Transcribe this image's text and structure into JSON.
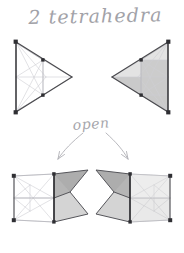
{
  "page": {
    "width": 184,
    "height": 253,
    "background_color": "#ffffff",
    "medium": "pencil-sketch",
    "title": "2 tetrahedra",
    "step_label": "open"
  },
  "colors": {
    "paper": "#ffffff",
    "ink_light": "#b9b9bf",
    "ink_mid": "#8e8e94",
    "ink_dark": "#3a3a3e",
    "fill_light": "#e3e3e3",
    "fill_mid": "#c9c9c9",
    "fill_dark": "#a8a8a8",
    "handwriting": "#a2a2a8"
  },
  "figures": [
    {
      "id": "top-left-tetrahedron",
      "name": "closed-tetrahedron-left",
      "position": "top-left",
      "state": "closed",
      "apex_direction": "right",
      "shaded": false,
      "outline": [
        [
          16,
          42
        ],
        [
          72,
          77
        ],
        [
          16,
          112
        ]
      ],
      "spine": [
        [
          16,
          42
        ],
        [
          16,
          112
        ]
      ],
      "inner_nodes": [
        [
          43,
          60
        ],
        [
          43,
          95
        ],
        [
          16,
          77
        ],
        [
          46,
          77
        ]
      ]
    },
    {
      "id": "top-right-tetrahedron",
      "name": "closed-tetrahedron-right",
      "position": "top-right",
      "state": "closed",
      "apex_direction": "left",
      "shaded": true,
      "outline": [
        [
          168,
          42
        ],
        [
          112,
          77
        ],
        [
          168,
          112
        ]
      ],
      "spine": [
        [
          168,
          42
        ],
        [
          168,
          112
        ]
      ],
      "inner_nodes": [
        [
          141,
          60
        ],
        [
          141,
          95
        ],
        [
          168,
          77
        ],
        [
          138,
          77
        ]
      ]
    },
    {
      "id": "bottom-left-tetrahedron",
      "name": "opened-tetrahedron-left",
      "position": "bottom-left",
      "state": "opened",
      "apex_direction": "right",
      "shaded": true,
      "hinge": [
        [
          54,
          174
        ],
        [
          54,
          222
        ]
      ],
      "flaps": 2
    },
    {
      "id": "bottom-right-tetrahedron",
      "name": "opened-tetrahedron-right",
      "position": "bottom-right",
      "state": "opened",
      "apex_direction": "left",
      "shaded": true,
      "hinge": [
        [
          130,
          174
        ],
        [
          130,
          222
        ]
      ],
      "flaps": 2
    }
  ],
  "arrows": [
    {
      "id": "arrow-left",
      "name": "open-arrow-left",
      "from": [
        82,
        132
      ],
      "to": [
        57,
        160
      ],
      "direction": "down-left"
    },
    {
      "id": "arrow-right",
      "name": "open-arrow-right",
      "from": [
        108,
        132
      ],
      "to": [
        128,
        160
      ],
      "direction": "down-right"
    }
  ]
}
